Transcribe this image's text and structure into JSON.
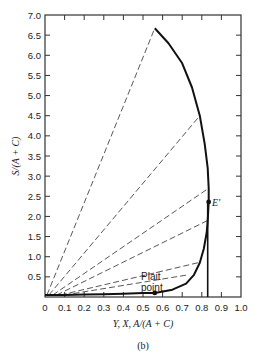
{
  "chart_data": {
    "type": "line",
    "title": "",
    "caption": "(b)",
    "xlabel": "Y, X, A/(A + C)",
    "ylabel": "S/(A + C)",
    "xlim": [
      0,
      1.0
    ],
    "ylim": [
      0,
      7.0
    ],
    "xticks": [
      "0",
      "0.1",
      "0.2",
      "0.3",
      "0.4",
      "0.5",
      "0.6",
      "0.7",
      "0.8",
      "0.9",
      "1.0"
    ],
    "yticks": [
      "0.5",
      "1.0",
      "1.5",
      "2.0",
      "2.5",
      "3.0",
      "3.5",
      "4.0",
      "4.5",
      "5.0",
      "5.5",
      "6.0",
      "6.5",
      "7.0"
    ],
    "grid": false,
    "series": [
      {
        "name": "Phase envelope (solubility curve)",
        "style": "solid-thick",
        "points": [
          [
            0.0,
            0.05
          ],
          [
            0.1,
            0.05
          ],
          [
            0.2,
            0.06
          ],
          [
            0.3,
            0.07
          ],
          [
            0.4,
            0.08
          ],
          [
            0.5,
            0.1
          ],
          [
            0.56,
            0.1
          ],
          [
            0.65,
            0.18
          ],
          [
            0.72,
            0.33
          ],
          [
            0.76,
            0.55
          ],
          [
            0.79,
            0.85
          ],
          [
            0.81,
            1.2
          ],
          [
            0.825,
            1.6
          ],
          [
            0.83,
            1.9
          ],
          [
            0.835,
            2.36
          ],
          [
            0.835,
            2.7
          ],
          [
            0.83,
            3.2
          ],
          [
            0.815,
            3.8
          ],
          [
            0.79,
            4.5
          ],
          [
            0.75,
            5.2
          ],
          [
            0.7,
            5.8
          ],
          [
            0.63,
            6.3
          ],
          [
            0.56,
            6.67
          ]
        ]
      },
      {
        "name": "Vertical line",
        "style": "solid",
        "points": [
          [
            0.83,
            0.0
          ],
          [
            0.83,
            2.36
          ]
        ]
      }
    ],
    "tie_lines": [
      [
        [
          0.01,
          0.05
        ],
        [
          0.56,
          6.67
        ]
      ],
      [
        [
          0.02,
          0.05
        ],
        [
          0.79,
          4.5
        ]
      ],
      [
        [
          0.04,
          0.05
        ],
        [
          0.835,
          2.7
        ]
      ],
      [
        [
          0.06,
          0.05
        ],
        [
          0.83,
          1.9
        ]
      ],
      [
        [
          0.08,
          0.05
        ],
        [
          0.78,
          0.85
        ]
      ],
      [
        [
          0.1,
          0.05
        ],
        [
          0.73,
          0.55
        ]
      ]
    ],
    "annotations": [
      {
        "text": "E'",
        "x": 0.835,
        "y": 2.36,
        "marker": true
      },
      {
        "text": "Plait point",
        "x": 0.56,
        "y": 0.1,
        "marker": true
      }
    ]
  },
  "labels": {
    "xlabel": "Y, X, A/(A + C)",
    "ylabel": "S/(A + C)",
    "caption": "(b)",
    "e_prime": "E'",
    "plait_line1": "Plait",
    "plait_line2": "point"
  }
}
